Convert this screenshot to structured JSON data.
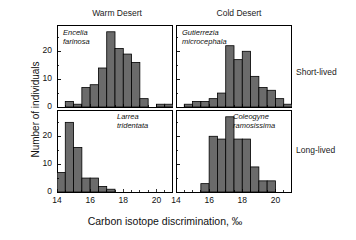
{
  "figure": {
    "x_axis_title": "Carbon isotope discrimination, ‰",
    "y_axis_title": "Number of individuals",
    "column_headers": [
      {
        "key": "warm",
        "label": "Warm Desert"
      },
      {
        "key": "cold",
        "label": "Cold Desert"
      }
    ],
    "row_labels": [
      {
        "key": "short",
        "label": "Short-lived"
      },
      {
        "key": "long",
        "label": "Long-lived"
      }
    ],
    "x_tick_labels": [
      "14",
      "16",
      "18",
      "20"
    ],
    "y_tick_labels": [
      "0",
      "10",
      "20"
    ]
  },
  "chart_data": {
    "type": "bar",
    "title": "",
    "xlabel": "Carbon isotope discrimination, ‰",
    "ylabel": "Number of individuals",
    "xlim": [
      14,
      21
    ],
    "ylim": [
      0,
      28
    ],
    "grid": false,
    "legend": "none",
    "bin_width": 0.5,
    "layout": {
      "rows": 2,
      "cols": 2
    },
    "panels": [
      {
        "id": "warm-short",
        "column": "Warm Desert",
        "row": "Short-lived",
        "species": "Encelia farinosa",
        "species_line1": "Encelia",
        "species_line2": "farinosa",
        "bin_starts": [
          14.0,
          14.5,
          15.0,
          15.5,
          16.0,
          16.5,
          17.0,
          17.5,
          18.0,
          18.5,
          19.0,
          19.5,
          20.0,
          20.5
        ],
        "values": [
          0,
          2,
          1,
          7,
          8,
          14,
          27,
          21,
          19,
          16,
          3,
          0,
          1,
          1
        ]
      },
      {
        "id": "cold-short",
        "column": "Cold Desert",
        "row": "Short-lived",
        "species": "Gutierrezia microcephala",
        "species_line1": "Gutierrezia",
        "species_line2": "microcephala",
        "bin_starts": [
          14.0,
          14.5,
          15.0,
          15.5,
          16.0,
          16.5,
          17.0,
          17.5,
          18.0,
          18.5,
          19.0,
          19.5,
          20.0,
          20.5
        ],
        "values": [
          0,
          1,
          2,
          2,
          3,
          5,
          22,
          17,
          20,
          11,
          7,
          6,
          3,
          1
        ]
      },
      {
        "id": "warm-long",
        "column": "Warm Desert",
        "row": "Long-lived",
        "species": "Larrea tridentata",
        "species_line1": "Larrea",
        "species_line2": "tridentata",
        "bin_starts": [
          14.0,
          14.5,
          15.0,
          15.5,
          16.0,
          16.5,
          17.0,
          17.5,
          18.0,
          18.5,
          19.0,
          19.5,
          20.0,
          20.5
        ],
        "values": [
          7,
          25,
          16,
          5,
          5,
          2,
          1,
          0,
          0,
          0,
          0,
          0,
          0,
          0
        ]
      },
      {
        "id": "cold-long",
        "column": "Cold Desert",
        "row": "Long-lived",
        "species": "Coleogyne ramosissima",
        "species_line1": "Coleogyne",
        "species_line2": "ramosissima",
        "bin_starts": [
          14.0,
          14.5,
          15.0,
          15.5,
          16.0,
          16.5,
          17.0,
          17.5,
          18.0,
          18.5,
          19.0,
          19.5,
          20.0,
          20.5
        ],
        "values": [
          0,
          0,
          0,
          3,
          20,
          19,
          27,
          19,
          19,
          9,
          4,
          4,
          0,
          0
        ]
      }
    ],
    "colors": {
      "bar_fill": "#6b6b6b",
      "bar_edge": "#000000",
      "axis": "#000000",
      "text": "#111111"
    }
  }
}
